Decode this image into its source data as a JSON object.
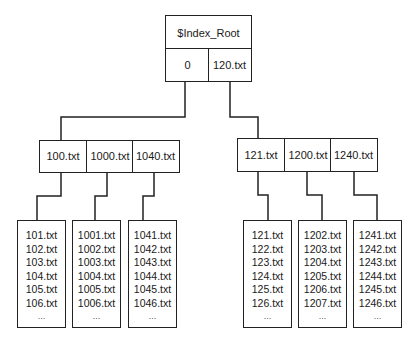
{
  "root": {
    "title": "$Index_Root",
    "entries": [
      "0",
      "120.txt"
    ]
  },
  "index_nodes": [
    {
      "entries": [
        "100.txt",
        "1000.txt",
        "1040.txt"
      ]
    },
    {
      "entries": [
        "121.txt",
        "1200.txt",
        "1240.txt"
      ]
    }
  ],
  "leaves": [
    {
      "files": [
        "101.txt",
        "102.txt",
        "103.txt",
        "104.txt",
        "105.txt",
        "106.txt",
        "..."
      ]
    },
    {
      "files": [
        "1001.txt",
        "1002.txt",
        "1003.txt",
        "1004.txt",
        "1005.txt",
        "1006.txt",
        "..."
      ]
    },
    {
      "files": [
        "1041.txt",
        "1042.txt",
        "1043.txt",
        "1044.txt",
        "1045.txt",
        "1046.txt",
        "..."
      ]
    },
    {
      "files": [
        "121.txt",
        "122.txt",
        "123.txt",
        "124.txt",
        "125.txt",
        "126.txt",
        "..."
      ]
    },
    {
      "files": [
        "1202.txt",
        "1203.txt",
        "1204.txt",
        "1205.txt",
        "1206.txt",
        "1207.txt",
        "..."
      ]
    },
    {
      "files": [
        "1241.txt",
        "1242.txt",
        "1243.txt",
        "1244.txt",
        "1245.txt",
        "1246.txt",
        "..."
      ]
    }
  ]
}
